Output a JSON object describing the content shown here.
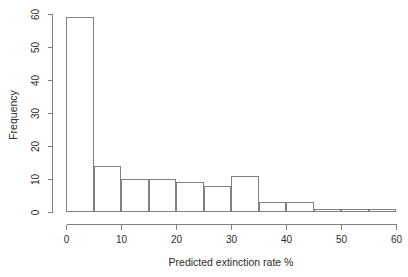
{
  "chart_data": {
    "type": "bar",
    "title": "",
    "subtitle": "",
    "xlabel": "Predicted extinction rate %",
    "ylabel": "Frequency",
    "xlim": [
      0,
      60
    ],
    "ylim": [
      0,
      60
    ],
    "xticks": [
      0,
      10,
      20,
      30,
      40,
      50,
      60
    ],
    "xtick_labels": [
      "0",
      "10",
      "20",
      "30",
      "40",
      "50",
      "60"
    ],
    "yticks": [
      0,
      10,
      20,
      30,
      40,
      50,
      60
    ],
    "ytick_labels": [
      "0",
      "10",
      "20",
      "30",
      "40",
      "50",
      "60"
    ],
    "grid": false,
    "legend": null,
    "bin_width": 5,
    "bin_edges": [
      0,
      5,
      10,
      15,
      20,
      25,
      30,
      35,
      40,
      45,
      50,
      55,
      60
    ],
    "categories": [
      "0-5",
      "5-10",
      "10-15",
      "15-20",
      "20-25",
      "25-30",
      "30-35",
      "35-40",
      "40-45",
      "45-50",
      "50-55",
      "55-60"
    ],
    "values": [
      59,
      14,
      10,
      10,
      9,
      8,
      11,
      3,
      3,
      1,
      1,
      1
    ],
    "bar_fill": "#ffffff",
    "bar_stroke": "#808080",
    "axis_color": "#808080",
    "text_color": "#2b2b2b",
    "background": "#ffffff"
  }
}
